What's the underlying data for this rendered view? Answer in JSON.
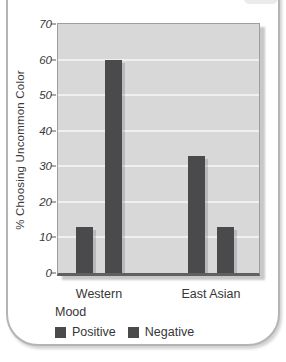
{
  "chart_data": {
    "type": "bar",
    "categories": [
      "Western",
      "East Asian"
    ],
    "series": [
      {
        "name": "Positive",
        "values": [
          13,
          33
        ],
        "color": "#4a4a4c"
      },
      {
        "name": "Negative",
        "values": [
          60,
          13
        ],
        "color": "#4a4a4c"
      }
    ],
    "title": "",
    "xlabel": "",
    "ylabel": "% Choosing Uncommon Color",
    "ylim": [
      0,
      70
    ],
    "yticks": [
      0,
      10,
      20,
      30,
      40,
      50,
      60,
      70
    ],
    "grid": "horizontal",
    "gridline_color": "#f0f0f0",
    "plot_bg": "#d8d8d8",
    "legend": {
      "title": "Mood",
      "position": "bottom-left"
    }
  }
}
